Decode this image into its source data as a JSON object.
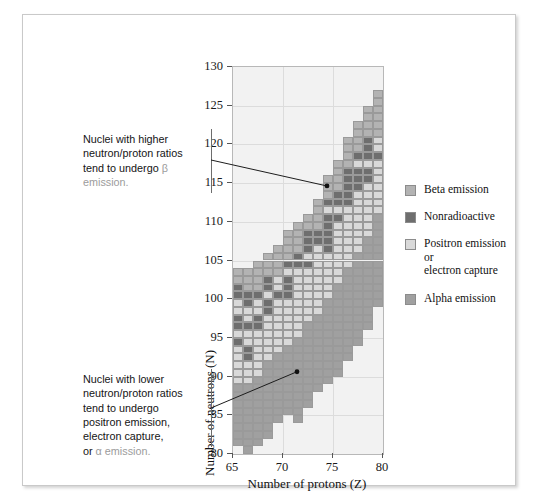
{
  "figure": {
    "xaxis_title": "Number of protons (Z)",
    "yaxis_title": "Number of neutrons (N)"
  },
  "annotations": {
    "top": {
      "line1": "Nuclei with higher",
      "line2": "neutron/proton ratios",
      "line3": "tend to undergo ",
      "symbol": "β",
      "line4": "emission."
    },
    "bottom": {
      "line1": "Nuclei with lower",
      "line2": "neutron/proton ratios",
      "line3": "tend to undergo",
      "line4": "positron emission,",
      "line5": "electron capture,",
      "line6_prefix": "or ",
      "symbol": "α",
      "line6_suffix": " emission."
    }
  },
  "legend": {
    "position": "right",
    "items": [
      {
        "label": "Beta emission",
        "color": "#b3b3b3",
        "key": "beta"
      },
      {
        "label": "Nonradioactive",
        "color": "#6e6e6e",
        "key": "stable"
      },
      {
        "label": "Positron emission or electron capture",
        "line1": "Positron emission or",
        "line2": "electron capture",
        "color": "#d9d9d9",
        "key": "positron"
      },
      {
        "label": "Alpha emission",
        "color": "#a0a0a0",
        "key": "alpha"
      }
    ]
  },
  "chart_data": {
    "type": "heatmap",
    "title": "",
    "xlabel": "Number of protons (Z)",
    "ylabel": "Number of neutrons (N)",
    "xlim": [
      65,
      80
    ],
    "ylim": [
      80,
      130
    ],
    "xticks": [
      65,
      70,
      75,
      80
    ],
    "yticks": [
      80,
      85,
      90,
      95,
      100,
      105,
      110,
      115,
      120,
      125,
      130
    ],
    "grid": true,
    "cell_size": {
      "z": 1,
      "n": 1
    },
    "categories": [
      "beta",
      "stable",
      "positron",
      "alpha"
    ],
    "colors": {
      "beta": "#b3b3b3",
      "stable": "#6e6e6e",
      "positron": "#d9d9d9",
      "alpha": "#a0a0a0",
      "background": "#f2f2f2",
      "grid": "#dcdcdc",
      "cell_border": "#9a9a9a"
    },
    "annotated_points": [
      {
        "z": 74,
        "n": 114,
        "note": "beta emission region marker"
      },
      {
        "z": 71,
        "n": 90,
        "note": "positron / electron capture / alpha region marker"
      }
    ],
    "columns": [
      {
        "z": 65,
        "bands": [
          {
            "type": "alpha",
            "n_from": 81,
            "n_to": 88
          },
          {
            "type": "positron",
            "n_from": 89,
            "n_to": 93
          },
          {
            "type": "stable",
            "n_from": 94,
            "n_to": 94
          },
          {
            "type": "positron",
            "n_from": 95,
            "n_to": 95
          },
          {
            "type": "stable",
            "n_from": 96,
            "n_to": 97
          },
          {
            "type": "positron",
            "n_from": 98,
            "n_to": 99
          },
          {
            "type": "stable",
            "n_from": 100,
            "n_to": 101
          },
          {
            "type": "beta",
            "n_from": 102,
            "n_to": 103
          }
        ]
      },
      {
        "z": 66,
        "bands": [
          {
            "type": "alpha",
            "n_from": 80,
            "n_to": 88
          },
          {
            "type": "positron",
            "n_from": 89,
            "n_to": 91
          },
          {
            "type": "stable",
            "n_from": 92,
            "n_to": 93
          },
          {
            "type": "positron",
            "n_from": 94,
            "n_to": 95
          },
          {
            "type": "stable",
            "n_from": 96,
            "n_to": 96
          },
          {
            "type": "positron",
            "n_from": 97,
            "n_to": 98
          },
          {
            "type": "stable",
            "n_from": 99,
            "n_to": 100
          },
          {
            "type": "beta",
            "n_from": 101,
            "n_to": 103
          }
        ]
      },
      {
        "z": 67,
        "bands": [
          {
            "type": "alpha",
            "n_from": 81,
            "n_to": 89
          },
          {
            "type": "positron",
            "n_from": 90,
            "n_to": 95
          },
          {
            "type": "stable",
            "n_from": 96,
            "n_to": 97
          },
          {
            "type": "positron",
            "n_from": 98,
            "n_to": 99
          },
          {
            "type": "stable",
            "n_from": 100,
            "n_to": 100
          },
          {
            "type": "beta",
            "n_from": 101,
            "n_to": 104
          }
        ]
      },
      {
        "z": 68,
        "bands": [
          {
            "type": "alpha",
            "n_from": 82,
            "n_to": 91
          },
          {
            "type": "positron",
            "n_from": 92,
            "n_to": 97
          },
          {
            "type": "stable",
            "n_from": 98,
            "n_to": 99
          },
          {
            "type": "positron",
            "n_from": 100,
            "n_to": 100
          },
          {
            "type": "stable",
            "n_from": 101,
            "n_to": 102
          },
          {
            "type": "beta",
            "n_from": 103,
            "n_to": 105
          }
        ]
      },
      {
        "z": 69,
        "bands": [
          {
            "type": "alpha",
            "n_from": 84,
            "n_to": 92
          },
          {
            "type": "positron",
            "n_from": 93,
            "n_to": 99
          },
          {
            "type": "stable",
            "n_from": 100,
            "n_to": 100
          },
          {
            "type": "positron",
            "n_from": 101,
            "n_to": 102
          },
          {
            "type": "beta",
            "n_from": 103,
            "n_to": 106
          }
        ]
      },
      {
        "z": 70,
        "bands": [
          {
            "type": "alpha",
            "n_from": 85,
            "n_to": 93
          },
          {
            "type": "positron",
            "n_from": 94,
            "n_to": 99
          },
          {
            "type": "stable",
            "n_from": 100,
            "n_to": 102
          },
          {
            "type": "positron",
            "n_from": 103,
            "n_to": 103
          },
          {
            "type": "stable",
            "n_from": 104,
            "n_to": 104
          },
          {
            "type": "beta",
            "n_from": 105,
            "n_to": 108
          }
        ]
      },
      {
        "z": 71,
        "bands": [
          {
            "type": "alpha",
            "n_from": 84,
            "n_to": 94
          },
          {
            "type": "positron",
            "n_from": 95,
            "n_to": 103
          },
          {
            "type": "stable",
            "n_from": 104,
            "n_to": 105
          },
          {
            "type": "beta",
            "n_from": 106,
            "n_to": 109
          }
        ]
      },
      {
        "z": 72,
        "bands": [
          {
            "type": "alpha",
            "n_from": 86,
            "n_to": 96
          },
          {
            "type": "positron",
            "n_from": 97,
            "n_to": 103
          },
          {
            "type": "stable",
            "n_from": 104,
            "n_to": 104
          },
          {
            "type": "positron",
            "n_from": 105,
            "n_to": 105
          },
          {
            "type": "stable",
            "n_from": 106,
            "n_to": 108
          },
          {
            "type": "beta",
            "n_from": 109,
            "n_to": 110
          }
        ]
      },
      {
        "z": 73,
        "bands": [
          {
            "type": "alpha",
            "n_from": 88,
            "n_to": 97
          },
          {
            "type": "positron",
            "n_from": 98,
            "n_to": 106
          },
          {
            "type": "stable",
            "n_from": 107,
            "n_to": 108
          },
          {
            "type": "beta",
            "n_from": 109,
            "n_to": 112
          }
        ]
      },
      {
        "z": 74,
        "bands": [
          {
            "type": "alpha",
            "n_from": 89,
            "n_to": 99
          },
          {
            "type": "positron",
            "n_from": 100,
            "n_to": 105
          },
          {
            "type": "stable",
            "n_from": 106,
            "n_to": 110
          },
          {
            "type": "positron",
            "n_from": 111,
            "n_to": 111
          },
          {
            "type": "stable",
            "n_from": 112,
            "n_to": 112
          },
          {
            "type": "beta",
            "n_from": 113,
            "n_to": 115
          }
        ]
      },
      {
        "z": 75,
        "bands": [
          {
            "type": "alpha",
            "n_from": 90,
            "n_to": 101
          },
          {
            "type": "positron",
            "n_from": 102,
            "n_to": 109
          },
          {
            "type": "stable",
            "n_from": 110,
            "n_to": 110
          },
          {
            "type": "positron",
            "n_from": 111,
            "n_to": 111
          },
          {
            "type": "stable",
            "n_from": 112,
            "n_to": 113
          },
          {
            "type": "beta",
            "n_from": 114,
            "n_to": 117
          }
        ]
      },
      {
        "z": 76,
        "bands": [
          {
            "type": "alpha",
            "n_from": 92,
            "n_to": 103
          },
          {
            "type": "positron",
            "n_from": 104,
            "n_to": 111
          },
          {
            "type": "stable",
            "n_from": 112,
            "n_to": 116
          },
          {
            "type": "beta",
            "n_from": 117,
            "n_to": 120
          }
        ]
      },
      {
        "z": 77,
        "bands": [
          {
            "type": "alpha",
            "n_from": 94,
            "n_to": 105
          },
          {
            "type": "positron",
            "n_from": 106,
            "n_to": 113
          },
          {
            "type": "stable",
            "n_from": 114,
            "n_to": 116
          },
          {
            "type": "positron",
            "n_from": 117,
            "n_to": 117
          },
          {
            "type": "stable",
            "n_from": 118,
            "n_to": 118
          },
          {
            "type": "beta",
            "n_from": 119,
            "n_to": 122
          }
        ]
      },
      {
        "z": 78,
        "bands": [
          {
            "type": "alpha",
            "n_from": 96,
            "n_to": 107
          },
          {
            "type": "positron",
            "n_from": 108,
            "n_to": 114
          },
          {
            "type": "stable",
            "n_from": 115,
            "n_to": 116
          },
          {
            "type": "positron",
            "n_from": 117,
            "n_to": 117
          },
          {
            "type": "stable",
            "n_from": 118,
            "n_to": 120
          },
          {
            "type": "beta",
            "n_from": 121,
            "n_to": 124
          }
        ]
      },
      {
        "z": 79,
        "bands": [
          {
            "type": "alpha",
            "n_from": 99,
            "n_to": 110
          },
          {
            "type": "positron",
            "n_from": 111,
            "n_to": 117
          },
          {
            "type": "stable",
            "n_from": 118,
            "n_to": 118
          },
          {
            "type": "positron",
            "n_from": 119,
            "n_to": 120
          },
          {
            "type": "beta",
            "n_from": 121,
            "n_to": 126
          }
        ]
      }
    ]
  }
}
